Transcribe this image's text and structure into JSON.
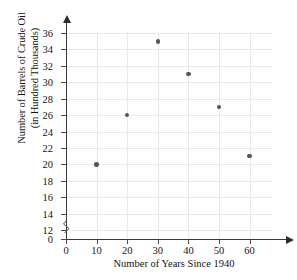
{
  "chart_data": {
    "type": "scatter",
    "title": "",
    "xlabel": "Number of Years Since 1940",
    "ylabel": "Number of Barrels of Crude Oil (in Hundred Thousands)",
    "ylabel_line1": "Number of Barrels of Crude Oil",
    "ylabel_line2": "(in Hundred Thousands)",
    "x": [
      10,
      20,
      30,
      40,
      50,
      60
    ],
    "values": [
      20,
      26,
      35,
      31,
      27,
      21
    ],
    "points": [
      {
        "x": 10,
        "y": 20
      },
      {
        "x": 20,
        "y": 26
      },
      {
        "x": 30,
        "y": 35
      },
      {
        "x": 40,
        "y": 31
      },
      {
        "x": 50,
        "y": 27
      },
      {
        "x": 60,
        "y": 21
      }
    ],
    "xlim": [
      0,
      65
    ],
    "ylim": [
      0,
      37
    ],
    "xticks": [
      0,
      10,
      20,
      30,
      40,
      50,
      60
    ],
    "xtick_labels": [
      "0",
      "10",
      "20",
      "30",
      "40",
      "50",
      "60"
    ],
    "yticks": [
      0,
      12,
      14,
      16,
      18,
      20,
      22,
      24,
      26,
      28,
      30,
      32,
      34,
      36
    ],
    "ytick_labels": [
      "0",
      "12",
      "14",
      "16",
      "18",
      "20",
      "22",
      "24",
      "26",
      "28",
      "30",
      "32",
      "34",
      "36"
    ],
    "y_axis_break": true,
    "y_axis_break_between": [
      0,
      12
    ],
    "grid": true,
    "legend": null,
    "marker_color": "#555558",
    "grid_color": "#e9e9ec",
    "axis_color": "#3a3a3a",
    "text_color": "#141414",
    "background": "#ffffff"
  }
}
